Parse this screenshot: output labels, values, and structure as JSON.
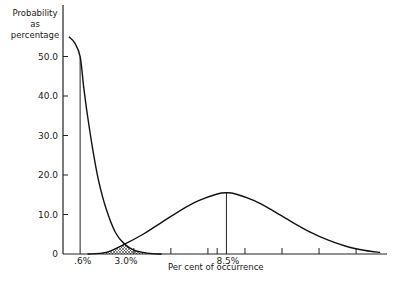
{
  "chart_data": {
    "type": "line",
    "title": "",
    "ylabel": "Probability as percentage",
    "xlabel": "Per cent of occurrence",
    "ylim": [
      0,
      58
    ],
    "y_ticks": [
      "0",
      "10.0",
      "20.0",
      "30.0",
      "40.0",
      "50.0"
    ],
    "x_tick_labels": [
      ".6%",
      "3.0%",
      "8.5%"
    ],
    "grid": false,
    "legend": null,
    "series": [
      {
        "name": "Left distribution (mode at 0.6%)",
        "x": [
          0.0,
          0.3,
          0.6,
          0.8,
          1.0,
          1.3,
          1.6,
          2.0,
          2.5,
          3.0,
          3.5,
          4.0,
          4.5,
          5.0
        ],
        "y": [
          55.0,
          53.5,
          50.0,
          42.0,
          35.0,
          26.0,
          18.5,
          11.5,
          5.5,
          2.5,
          1.0,
          0.4,
          0.1,
          0.0
        ]
      },
      {
        "name": "Right distribution (mode at 8.5%)",
        "x": [
          1.0,
          2.0,
          3.0,
          4.0,
          5.0,
          6.0,
          7.0,
          8.0,
          8.5,
          9.0,
          10.0,
          11.0,
          12.0,
          13.0,
          14.0,
          15.0,
          16.0,
          16.8
        ],
        "y": [
          0.0,
          0.4,
          2.5,
          5.0,
          8.0,
          11.0,
          13.5,
          15.2,
          15.5,
          15.2,
          13.5,
          11.0,
          8.2,
          5.6,
          3.5,
          1.9,
          0.9,
          0.4
        ]
      }
    ],
    "annotations": [
      {
        "type": "vline",
        "x": 0.6,
        "label": ".6%"
      },
      {
        "type": "vline",
        "x": 8.5,
        "label": "8.5%"
      },
      {
        "type": "hatched_overlap",
        "x_range": [
          1.0,
          5.0
        ],
        "center_x": 3.0,
        "label": "3.0%"
      }
    ],
    "x_minor_ticks": [
      3.5,
      5.5,
      7.5,
      8.0,
      9.5,
      11.5,
      13.5,
      15.5
    ]
  }
}
